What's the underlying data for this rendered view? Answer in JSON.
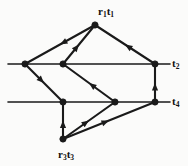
{
  "figure": {
    "kind": "directed-graph-diagram",
    "title": "",
    "background_color": "#fbfbfa",
    "stroke_color": "#1a1a1a",
    "width": 188,
    "height": 166
  },
  "labels": {
    "top_vertex": {
      "base": "r",
      "sub1": "1",
      "base2": "t",
      "sub2": "1",
      "text": "r1t1"
    },
    "bottom_vertex": {
      "base": "r",
      "sub1": "3",
      "base2": "t",
      "sub2": "3",
      "text": "r3t3"
    },
    "upper_line": {
      "base": "t",
      "sub": "2",
      "text": "t2"
    },
    "lower_line": {
      "base": "t",
      "sub": "4",
      "text": "t4"
    }
  },
  "graph_data": {
    "type": "diagram",
    "nodes": [
      {
        "id": "r1t1",
        "x": 95,
        "y": 25,
        "label": "r1t1",
        "filled": true
      },
      {
        "id": "A",
        "x": 25,
        "y": 64,
        "label": "",
        "filled": true
      },
      {
        "id": "B",
        "x": 63,
        "y": 64,
        "label": "",
        "filled": true
      },
      {
        "id": "E",
        "x": 155,
        "y": 64,
        "label": "",
        "filled": true
      },
      {
        "id": "C",
        "x": 63,
        "y": 102,
        "label": "",
        "filled": true
      },
      {
        "id": "D",
        "x": 115,
        "y": 102,
        "label": "",
        "filled": true
      },
      {
        "id": "F",
        "x": 155,
        "y": 102,
        "label": "",
        "filled": true
      },
      {
        "id": "r3t3",
        "x": 63,
        "y": 139,
        "label": "r3t3",
        "filled": true
      }
    ],
    "horizontal_lines": [
      {
        "id": "t2-line",
        "y": 64,
        "x1": 8,
        "x2": 170,
        "label": "t2"
      },
      {
        "id": "t4-line",
        "y": 102,
        "x1": 8,
        "x2": 170,
        "label": "t4"
      }
    ],
    "edges": [
      {
        "from": "r1t1",
        "to": "A",
        "arrow_at": 0.5,
        "direction": "to"
      },
      {
        "from": "B",
        "to": "r1t1",
        "arrow_at": 0.5,
        "direction": "to"
      },
      {
        "from": "E",
        "to": "r1t1",
        "arrow_at": 0.5,
        "direction": "to"
      },
      {
        "from": "A",
        "to": "C",
        "arrow_at": 0.5,
        "direction": "to"
      },
      {
        "from": "D",
        "to": "B",
        "arrow_at": 0.5,
        "direction": "to"
      },
      {
        "from": "r3t3",
        "to": "C",
        "arrow_at": 0.5,
        "direction": "to"
      },
      {
        "from": "r3t3",
        "to": "D",
        "arrow_at": 0.5,
        "direction": "to"
      },
      {
        "from": "r3t3",
        "to": "F",
        "arrow_at": 0.5,
        "direction": "to"
      },
      {
        "from": "F",
        "to": "E",
        "arrow_at": 0.5,
        "direction": "to"
      }
    ]
  }
}
